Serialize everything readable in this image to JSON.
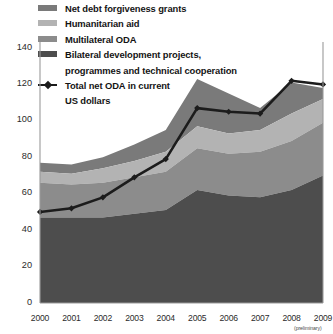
{
  "chart_data": {
    "type": "area",
    "stacked": true,
    "title": "",
    "subtitle": "",
    "xlabel": "",
    "ylabel": "",
    "x": [
      "2000",
      "2001",
      "2002",
      "2003",
      "2004",
      "2005",
      "2006",
      "2007",
      "2008",
      "2009"
    ],
    "categories": [
      "2000",
      "2001",
      "2002",
      "2003",
      "2004",
      "2005",
      "2006",
      "2007",
      "2008",
      "2009"
    ],
    "xlim": [
      2000,
      2009
    ],
    "ylim": [
      0,
      140
    ],
    "yticks": [
      0,
      20,
      40,
      60,
      80,
      100,
      120,
      140
    ],
    "ytick_labels": [
      "0",
      "20",
      "40",
      "60",
      "80",
      "100",
      "120",
      "140"
    ],
    "grid": false,
    "legend_position": "top-left",
    "series": [
      {
        "name": "Bilateral development projects, programmes and technical cooperation",
        "type": "area",
        "color": "#4d4d4d",
        "stack_order": 1,
        "values": [
          47,
          47,
          47,
          49,
          51,
          62,
          59,
          58,
          62,
          70
        ]
      },
      {
        "name": "Multilateral ODA",
        "type": "area",
        "color": "#8c8c8c",
        "stack_order": 2,
        "values": [
          19,
          18,
          19,
          20,
          21,
          23,
          23,
          25,
          27,
          29
        ]
      },
      {
        "name": "Humanitarian aid",
        "type": "area",
        "color": "#b3b3b3",
        "stack_order": 3,
        "values": [
          6,
          6,
          8,
          9,
          11,
          12,
          11,
          12,
          15,
          13
        ]
      },
      {
        "name": "Net debt forgiveness grants",
        "type": "area",
        "color": "#7a7a7a",
        "stack_order": 4,
        "values": [
          5,
          5,
          6,
          9,
          12,
          26,
          22,
          12,
          17,
          6
        ]
      },
      {
        "name": "Total net ODA in current US dollars",
        "type": "line",
        "color": "#1c1c1c",
        "marker": "diamond",
        "values": [
          50,
          52,
          58,
          69,
          79,
          107,
          105,
          104,
          122,
          120
        ]
      }
    ],
    "annotations": [
      {
        "name": "preliminary-note",
        "text": "(preliminary)",
        "anchor_x": "2009"
      }
    ]
  },
  "legend": {
    "items": [
      {
        "label": "Net debt forgiveness grants",
        "color": "#7a7a7a",
        "kind": "swatch"
      },
      {
        "label": "Humanitarian aid",
        "color": "#b3b3b3",
        "kind": "swatch"
      },
      {
        "label": "Multilateral ODA",
        "color": "#8c8c8c",
        "kind": "swatch"
      },
      {
        "label": "Bilateral development projects,",
        "color": "#4d4d4d",
        "kind": "swatch"
      },
      {
        "label": "programmes and technical cooperation",
        "color": "",
        "kind": "continuation"
      },
      {
        "label": "Total net ODA in current",
        "color": "#1c1c1c",
        "kind": "line"
      },
      {
        "label": "US dollars",
        "color": "",
        "kind": "continuation"
      }
    ]
  },
  "axis": {
    "y_labels": [
      "140",
      "120",
      "100",
      "80",
      "60",
      "40",
      "20",
      "0"
    ],
    "x_labels": [
      "2000",
      "2001",
      "2002",
      "2003",
      "2004",
      "2005",
      "2006",
      "2007",
      "2008",
      "2009"
    ],
    "preliminary_note": "(preliminary)"
  },
  "colors": {
    "band_debt_relief": "#7a7a7a",
    "band_humanitarian": "#b3b3b3",
    "band_multilateral": "#8c8c8c",
    "band_bilateral": "#4d4d4d",
    "total_line": "#1c1c1c",
    "axis": "#9a9a9a",
    "text": "#2b2b2b"
  }
}
